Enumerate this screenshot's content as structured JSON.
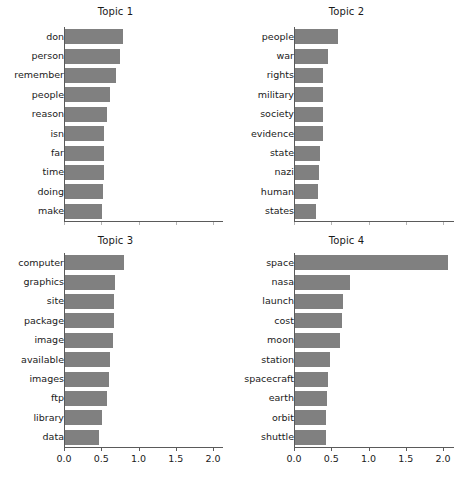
{
  "figure": {
    "width": 462,
    "height": 481,
    "bar_color": "#808080",
    "axis_color": "#5a5a5a",
    "background": "#ffffff"
  },
  "chart_data": [
    {
      "type": "bar",
      "orientation": "horizontal",
      "title": "Topic 1",
      "xlabel": "",
      "ylabel": "",
      "xlim": [
        0.0,
        2.2
      ],
      "grid": false,
      "legend": null,
      "xticks": [
        "0.0",
        "0.5",
        "1.0",
        "1.5",
        "2.0"
      ],
      "xtick_values": [
        0.0,
        0.5,
        1.0,
        1.5,
        2.0
      ],
      "xticklabels_visible": false,
      "categories": [
        "don",
        "person",
        "remember",
        "people",
        "reason",
        "isn",
        "far",
        "time",
        "doing",
        "make"
      ],
      "values": [
        0.78,
        0.74,
        0.68,
        0.6,
        0.56,
        0.53,
        0.53,
        0.52,
        0.51,
        0.5
      ]
    },
    {
      "type": "bar",
      "orientation": "horizontal",
      "title": "Topic 2",
      "xlabel": "",
      "ylabel": "",
      "xlim": [
        0.0,
        2.2
      ],
      "grid": false,
      "legend": null,
      "xticks": [
        "0.0",
        "0.5",
        "1.0",
        "1.5",
        "2.0"
      ],
      "xtick_values": [
        0.0,
        0.5,
        1.0,
        1.5,
        2.0
      ],
      "xticklabels_visible": false,
      "categories": [
        "people",
        "war",
        "rights",
        "military",
        "society",
        "evidence",
        "state",
        "nazi",
        "human",
        "states"
      ],
      "values": [
        0.58,
        0.44,
        0.38,
        0.38,
        0.38,
        0.38,
        0.33,
        0.32,
        0.31,
        0.28
      ]
    },
    {
      "type": "bar",
      "orientation": "horizontal",
      "title": "Topic 3",
      "xlabel": "",
      "ylabel": "",
      "xlim": [
        0.0,
        2.2
      ],
      "grid": false,
      "legend": null,
      "xticks": [
        "0.0",
        "0.5",
        "1.0",
        "1.5",
        "2.0"
      ],
      "xtick_values": [
        0.0,
        0.5,
        1.0,
        1.5,
        2.0
      ],
      "xticklabels_visible": true,
      "categories": [
        "computer",
        "graphics",
        "site",
        "package",
        "image",
        "available",
        "images",
        "ftp",
        "library",
        "data"
      ],
      "values": [
        0.79,
        0.67,
        0.66,
        0.66,
        0.64,
        0.6,
        0.59,
        0.56,
        0.5,
        0.46
      ]
    },
    {
      "type": "bar",
      "orientation": "horizontal",
      "title": "Topic 4",
      "xlabel": "",
      "ylabel": "",
      "xlim": [
        0.0,
        2.2
      ],
      "grid": false,
      "legend": null,
      "xticks": [
        "0.0",
        "0.5",
        "1.0",
        "1.5",
        "2.0"
      ],
      "xtick_values": [
        0.0,
        0.5,
        1.0,
        1.5,
        2.0
      ],
      "xticklabels_visible": true,
      "categories": [
        "space",
        "nasa",
        "launch",
        "cost",
        "moon",
        "station",
        "spacecraft",
        "earth",
        "orbit",
        "shuttle"
      ],
      "values": [
        2.05,
        0.74,
        0.64,
        0.63,
        0.6,
        0.47,
        0.44,
        0.43,
        0.42,
        0.41
      ]
    }
  ]
}
